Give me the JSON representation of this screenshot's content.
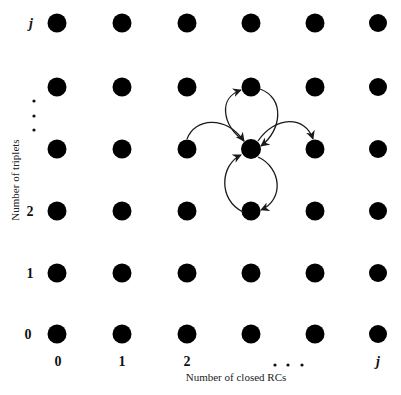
{
  "diagram": {
    "type": "state-lattice",
    "x_axis": {
      "label": "Number of closed RCs",
      "ticks": [
        "0",
        "1",
        "2",
        "j"
      ],
      "ellipsis": ". . ."
    },
    "y_axis": {
      "label": "Number of triplets",
      "ticks": [
        "0",
        "1",
        "2",
        "j"
      ],
      "ellipsis": ". . ."
    },
    "grid": {
      "columns": 6,
      "rows": 6,
      "node_color": "#000000"
    },
    "transitions": [
      {
        "from": "center",
        "to": "up",
        "style": "loop-left"
      },
      {
        "from": "up",
        "to": "center",
        "style": "loop-right"
      },
      {
        "from": "down",
        "to": "center",
        "style": "loop-left"
      },
      {
        "from": "center",
        "to": "down",
        "style": "loop-right"
      },
      {
        "from": "left",
        "to": "center",
        "style": "arc-over"
      },
      {
        "from": "center",
        "to": "right",
        "style": "arc-over"
      }
    ],
    "colors": {
      "node": "#000000",
      "edge": "#1a1a1a",
      "background": "#ffffff"
    }
  }
}
